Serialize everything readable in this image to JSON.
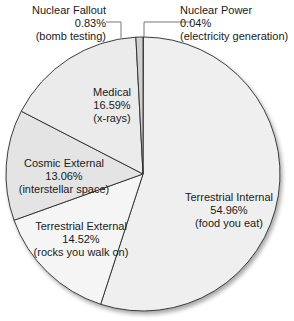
{
  "chart_data": {
    "type": "pie",
    "title": "",
    "start_angle_deg": 0,
    "direction": "clockwise",
    "slices": [
      {
        "name": "Nuclear Power",
        "value": 0.04,
        "label": "0.04%",
        "note": "(electricity generation)",
        "color": "#b8b8b8"
      },
      {
        "name": "Terrestrial Internal",
        "value": 54.96,
        "label": "54.96%",
        "note": "(food you eat)",
        "color": "#efefef"
      },
      {
        "name": "Terrestrial External",
        "value": 14.52,
        "label": "14.52%",
        "note": "(rocks you walk on)",
        "color": "#f5f5f5"
      },
      {
        "name": "Cosmic External",
        "value": 13.06,
        "label": "13.06%",
        "note": "(interstellar space)",
        "color": "#e4e4e4"
      },
      {
        "name": "Medical",
        "value": 16.59,
        "label": "16.59%",
        "note": "(x-rays)",
        "color": "#ebebeb"
      },
      {
        "name": "Nuclear Fallout",
        "value": 0.83,
        "label": "0.83%",
        "note": "(bomb testing)",
        "color": "#d0d0d0"
      }
    ],
    "legend": "none",
    "outline_color": "#2a2a2a"
  },
  "labels": {
    "nuclear_fallout": {
      "name": "Nuclear Fallout",
      "pct": "0.83%",
      "note": "(bomb testing)"
    },
    "nuclear_power": {
      "name": "Nuclear Power",
      "pct": "0.04%",
      "note": "(electricity generation)"
    },
    "medical": {
      "name": "Medical",
      "pct": "16.59%",
      "note": "(x-rays)"
    },
    "cosmic": {
      "name": "Cosmic External",
      "pct": "13.06%",
      "note": "(interstellar space)"
    },
    "terr_ext": {
      "name": "Terrestrial External",
      "pct": "14.52%",
      "note": "(rocks you walk on)"
    },
    "terr_int": {
      "name": "Terrestrial Internal",
      "pct": "54.96%",
      "note": "(food you eat)"
    }
  }
}
